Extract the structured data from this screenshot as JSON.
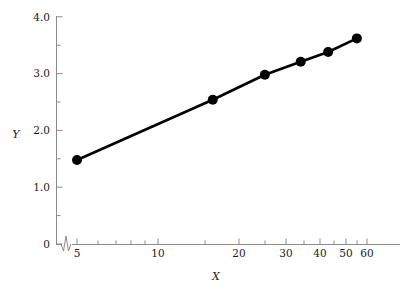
{
  "chart_data": {
    "type": "line",
    "title": "",
    "subtitle": "",
    "xlabel": "X",
    "ylabel": "Y",
    "xscale": "log",
    "yscale": "linear",
    "xlim": [
      4.3,
      62
    ],
    "ylim": [
      0,
      4.0
    ],
    "grid": false,
    "legend": null,
    "axis_break": {
      "axis": "x",
      "present": true,
      "note": "zigzag break symbol on x-axis between 0 and 5"
    },
    "xticks": [
      5,
      10,
      20,
      30,
      40,
      50,
      60
    ],
    "xtick_labels": [
      "5",
      "10",
      "20",
      "30",
      "40",
      "50",
      "60"
    ],
    "xminor_ticks": [
      6,
      7,
      8,
      9,
      15,
      25,
      35,
      45,
      55
    ],
    "yticks": [
      0,
      1.0,
      2.0,
      3.0,
      4.0
    ],
    "ytick_labels": [
      "0",
      "1.0",
      "2.0",
      "3.0",
      "4.0"
    ],
    "yminor_ticks": [
      0.5,
      1.5,
      2.5,
      3.5
    ],
    "origin_label": "0",
    "series": [
      {
        "name": "series-1",
        "color": "#000000",
        "marker": "filled-circle",
        "marker_size": 5,
        "line_width": 2.6,
        "x": [
          5,
          16,
          25,
          34,
          43,
          55
        ],
        "y": [
          1.48,
          2.54,
          2.98,
          3.21,
          3.38,
          3.62
        ]
      }
    ]
  },
  "axes": {
    "x_title": "X",
    "y_title": "Y"
  }
}
